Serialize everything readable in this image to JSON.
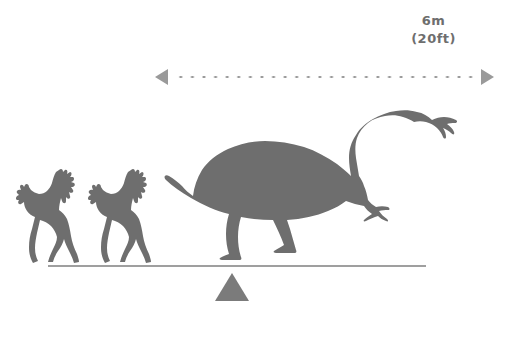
{
  "figure": {
    "type": "size-comparison-silhouette",
    "background_color": "#ffffff",
    "silhouette_color": "#6e6e6e",
    "line_color": "#9a9a9a"
  },
  "scale": {
    "metric": "6m",
    "imperial": "(20ft)",
    "arrow_icon_left": "arrow-left-icon",
    "arrow_icon_right": "arrow-right-icon",
    "line_style": "dotted"
  },
  "ground": {
    "baseline": "ground-line",
    "marker": "triangle-fulcrum"
  },
  "subjects": [
    {
      "name": "horse-silhouette-1",
      "species": "horse",
      "pose": "galloping",
      "facing": "left"
    },
    {
      "name": "horse-silhouette-2",
      "species": "horse",
      "pose": "galloping",
      "facing": "left"
    },
    {
      "name": "dinosaur-silhouette",
      "species": "prosauropod dinosaur",
      "pose": "standing",
      "facing": "right"
    }
  ]
}
